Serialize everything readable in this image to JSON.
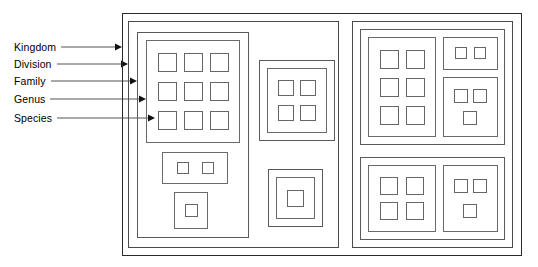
{
  "diagram": {
    "levels": [
      {
        "id": "kingdom",
        "label": "Kingdom",
        "label_y": 42,
        "leader_y": 47,
        "tip_x": 122
      },
      {
        "id": "division",
        "label": "Division",
        "label_y": 59,
        "leader_y": 64,
        "tip_x": 128
      },
      {
        "id": "family",
        "label": "Family",
        "label_y": 76,
        "leader_y": 81,
        "tip_x": 137
      },
      {
        "id": "genus",
        "label": "Genus",
        "label_y": 94,
        "leader_y": 99,
        "tip_x": 146
      },
      {
        "id": "species",
        "label": "Species",
        "label_y": 113,
        "leader_y": 118,
        "tip_x": 155
      }
    ],
    "colors": {
      "stroke_kingdom": "#2b2b2b",
      "stroke_division": "#4a4a4a",
      "stroke_family": "#5a5a5a",
      "stroke_genus": "#6a6a6a",
      "stroke_species": "#666666",
      "leader_line": "#555555",
      "text": "#000000",
      "background": "#ffffff"
    },
    "counts": {
      "divisions": 2,
      "families": 6,
      "genera": 10,
      "species": 38
    },
    "structure": {
      "kingdom_box": {
        "x": 122,
        "y": 13,
        "w": 400,
        "h": 243
      },
      "divisions": [
        {
          "name": "division-left",
          "box": {
            "x": 128,
            "y": 21,
            "w": 211,
            "h": 227
          },
          "families": [
            {
              "name": "family-left-top",
              "box": {
                "x": 137,
                "y": 32,
                "w": 112,
                "h": 206
              },
              "genera": [
                {
                  "name": "genus-3x3",
                  "box": {
                    "x": 146,
                    "y": 40,
                    "w": 94,
                    "h": 103
                  },
                  "species": 9,
                  "grid_cols": 3
                },
                {
                  "name": "genus-pair",
                  "box": {
                    "x": 162,
                    "y": 152,
                    "w": 66,
                    "h": 32
                  },
                  "species": 2,
                  "grid_cols": 2
                },
                {
                  "name": "genus-single",
                  "box": {
                    "x": 174,
                    "y": 192,
                    "w": 34,
                    "h": 37
                  },
                  "species": 1,
                  "grid_cols": 1
                }
              ]
            },
            {
              "name": "family-mid-top",
              "box": {
                "x": 259,
                "y": 60,
                "w": 76,
                "h": 81
              },
              "genera": [
                {
                  "name": "genus-2x2",
                  "box": {
                    "x": 267,
                    "y": 68,
                    "w": 60,
                    "h": 65
                  },
                  "species": 4,
                  "grid_cols": 2
                }
              ]
            },
            {
              "name": "family-mid-bottom",
              "box": {
                "x": 268,
                "y": 169,
                "w": 55,
                "h": 58
              },
              "genera": [
                {
                  "name": "genus-single-mid",
                  "box": {
                    "x": 276,
                    "y": 177,
                    "w": 39,
                    "h": 42
                  },
                  "species": 1,
                  "grid_cols": 1
                }
              ]
            }
          ]
        },
        {
          "name": "division-right",
          "box": {
            "x": 352,
            "y": 21,
            "w": 161,
            "h": 227
          },
          "families": [
            {
              "name": "family-right-top",
              "box": {
                "x": 360,
                "y": 29,
                "w": 145,
                "h": 116
              },
              "genera": [
                {
                  "name": "genus-3x2",
                  "box": {
                    "x": 368,
                    "y": 37,
                    "w": 68,
                    "h": 100
                  },
                  "species": 6,
                  "grid_cols": 2
                },
                {
                  "name": "genus-2",
                  "box": {
                    "x": 443,
                    "y": 37,
                    "w": 55,
                    "h": 33
                  },
                  "species": 2,
                  "grid_cols": 2
                },
                {
                  "name": "genus-3",
                  "box": {
                    "x": 443,
                    "y": 77,
                    "w": 55,
                    "h": 60
                  },
                  "species": 3,
                  "grid_cols": 2
                }
              ]
            },
            {
              "name": "family-right-bottom",
              "box": {
                "x": 360,
                "y": 157,
                "w": 145,
                "h": 83
              },
              "genera": [
                {
                  "name": "genus-2x2-br",
                  "box": {
                    "x": 368,
                    "y": 165,
                    "w": 68,
                    "h": 67
                  },
                  "species": 4,
                  "grid_cols": 2
                },
                {
                  "name": "genus-3-br",
                  "box": {
                    "x": 443,
                    "y": 165,
                    "w": 55,
                    "h": 67
                  },
                  "species": 3,
                  "grid_cols": 2
                }
              ]
            }
          ]
        }
      ]
    }
  }
}
